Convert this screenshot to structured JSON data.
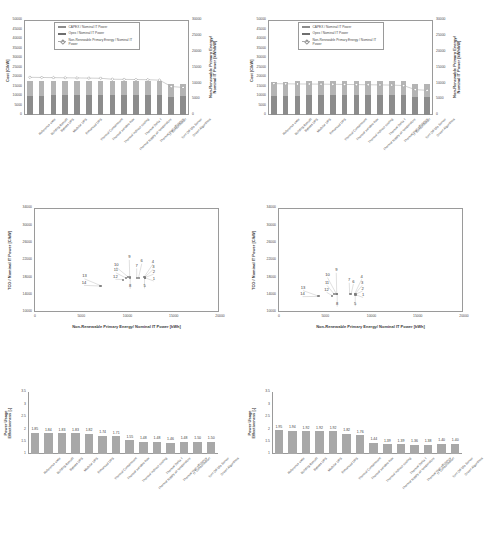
{
  "categories": [
    "Reference case",
    "Building Retrofit",
    "Bypass UPS",
    "Modular UPS",
    "Enhanced UPS",
    "Thermal Containment",
    "Thermal variable flow",
    "Thermal indirect cooling",
    "Thermal supply air temperature",
    "Thermal Delta T",
    "Thermal high efficiency",
    "IT Consolidation",
    "Turn Off Idle Server",
    "Green Algorithms"
  ],
  "combo_legend": {
    "capex": "CAPEX / Nominal IT Power",
    "opex": "Opex / Nominal IT Power",
    "energy": "Non-Renewable Primary Energy / Nominal IT Power"
  },
  "chart_data": [
    {
      "id": "combo-left",
      "type": "bar",
      "title": "",
      "xlabel": "",
      "ylabel": "Cost [C/kW]",
      "y2label": "Non-Renewable Primary Energy/ Nominal IT Power [kWh/kW]",
      "ylim": [
        0,
        50000
      ],
      "yticks": [
        0,
        5000,
        10000,
        15000,
        20000,
        25000,
        30000,
        35000,
        40000,
        45000,
        50000
      ],
      "y2lim": [
        0,
        30000
      ],
      "y2ticks": [
        0,
        5000,
        10000,
        15000,
        20000,
        25000,
        30000
      ],
      "grid": false,
      "legend_position": "top-center",
      "categories": [
        "Reference case",
        "Building Retrofit",
        "Bypass UPS",
        "Modular UPS",
        "Enhanced UPS",
        "Thermal Containment",
        "Thermal variable flow",
        "Thermal indirect cooling",
        "Thermal supply air temperature",
        "Thermal Delta T",
        "Thermal high efficiency",
        "IT Consolidation",
        "Turn Off Idle Server",
        "Green Algorithms"
      ],
      "series": [
        {
          "name": "CAPEX / Nominal IT Power",
          "values": [
            10200,
            10200,
            10300,
            10400,
            10500,
            10600,
            10700,
            10700,
            10700,
            10700,
            10700,
            10600,
            9700,
            9800
          ]
        },
        {
          "name": "Opex / Nominal IT Power",
          "values": [
            7600,
            7600,
            7500,
            7400,
            7300,
            7300,
            7300,
            7300,
            7300,
            7300,
            7300,
            7300,
            6500,
            6600
          ]
        },
        {
          "name": "Non-Renewable Primary Energy / Nominal IT Power",
          "values": [
            11900,
            11850,
            11800,
            11750,
            11700,
            11650,
            11600,
            11300,
            11250,
            11200,
            11150,
            11000,
            9000,
            8700
          ]
        }
      ]
    },
    {
      "id": "combo-right",
      "type": "bar",
      "title": "",
      "xlabel": "",
      "ylabel": "Cost [C/kW]",
      "y2label": "Non-Renewable Primary Energy/ Nominal IT Power [kWh/kW]",
      "ylim": [
        0,
        50000
      ],
      "yticks": [
        0,
        5000,
        10000,
        15000,
        20000,
        25000,
        30000,
        35000,
        40000,
        45000,
        50000
      ],
      "y2lim": [
        0,
        30000
      ],
      "y2ticks": [
        0,
        5000,
        10000,
        15000,
        20000,
        25000,
        30000
      ],
      "grid": false,
      "legend_position": "top-center",
      "categories": [
        "Reference case",
        "Building Retrofit",
        "Bypass UPS",
        "Modular UPS",
        "Enhanced UPS",
        "Thermal Containment",
        "Thermal variable flow",
        "Thermal indirect cooling",
        "Thermal supply air temperature",
        "Thermal Delta T",
        "Thermal high efficiency",
        "IT Consolidation",
        "Turn Off Idle Server",
        "Green Algorithms"
      ],
      "series": [
        {
          "name": "CAPEX / Nominal IT Power",
          "values": [
            10100,
            10100,
            10200,
            10300,
            10400,
            10500,
            10600,
            10700,
            10700,
            10700,
            10700,
            10600,
            9600,
            9700
          ]
        },
        {
          "name": "Opex / Nominal IT Power",
          "values": [
            7500,
            7500,
            7500,
            7400,
            7400,
            7400,
            7400,
            7400,
            7400,
            7400,
            7400,
            7400,
            6600,
            6700
          ]
        },
        {
          "name": "Non-Renewable Primary Energy / Nominal IT Power",
          "values": [
            9900,
            9850,
            9800,
            9780,
            9750,
            9700,
            9650,
            9600,
            9550,
            9500,
            9450,
            9300,
            8000,
            7800
          ]
        }
      ]
    },
    {
      "id": "scatter-left",
      "type": "scatter",
      "title": "",
      "xlabel": "Non-Renewable Primary Energy/ Nominal IT Power [kWh]",
      "ylabel": "TCO / Nominal IT Power [C/kW]",
      "xlim": [
        0,
        20000
      ],
      "xticks": [
        0,
        5000,
        10000,
        15000,
        20000
      ],
      "ylim": [
        10000,
        34000
      ],
      "yticks": [
        10000,
        14000,
        18000,
        22000,
        26000,
        30000,
        34000
      ],
      "grid": false,
      "points": [
        {
          "label": "1",
          "x": 12000,
          "y": 17900,
          "lx": 12950,
          "ly": 17700
        },
        {
          "label": "2",
          "x": 12000,
          "y": 17950,
          "lx": 12950,
          "ly": 19300
        },
        {
          "label": "3",
          "x": 11950,
          "y": 18000,
          "lx": 12900,
          "ly": 20400
        },
        {
          "label": "4",
          "x": 11900,
          "y": 18050,
          "lx": 12850,
          "ly": 21600
        },
        {
          "label": "5",
          "x": 11950,
          "y": 17850,
          "lx": 11950,
          "ly": 16000
        },
        {
          "label": "6",
          "x": 11300,
          "y": 17900,
          "lx": 11650,
          "ly": 21700
        },
        {
          "label": "7",
          "x": 11100,
          "y": 17950,
          "lx": 11100,
          "ly": 20600
        },
        {
          "label": "8",
          "x": 10400,
          "y": 17900,
          "lx": 10400,
          "ly": 15900
        },
        {
          "label": "9",
          "x": 10350,
          "y": 18000,
          "lx": 10300,
          "ly": 22600
        },
        {
          "label": "10",
          "x": 10200,
          "y": 18050,
          "lx": 8900,
          "ly": 20900
        },
        {
          "label": "11",
          "x": 9900,
          "y": 17900,
          "lx": 8850,
          "ly": 19600
        },
        {
          "label": "12",
          "x": 9600,
          "y": 17500,
          "lx": 8800,
          "ly": 18100
        },
        {
          "label": "13",
          "x": 7200,
          "y": 16100,
          "lx": 5450,
          "ly": 18200
        },
        {
          "label": "14",
          "x": 7150,
          "y": 16000,
          "lx": 5400,
          "ly": 16700
        }
      ]
    },
    {
      "id": "scatter-right",
      "type": "scatter",
      "title": "",
      "xlabel": "Non-Renewable Primary Energy/ Nominal IT Power [kWh]",
      "ylabel": "TCO / Nominal IT Power [C/kW]",
      "xlim": [
        0,
        20000
      ],
      "xticks": [
        0,
        5000,
        10000,
        15000,
        20000
      ],
      "ylim": [
        10000,
        34000
      ],
      "yticks": [
        10000,
        14000,
        18000,
        22000,
        26000,
        30000,
        34000
      ],
      "grid": false,
      "points": [
        {
          "label": "1",
          "x": 8400,
          "y": 14000,
          "lx": 9200,
          "ly": 13900
        },
        {
          "label": "2",
          "x": 8400,
          "y": 14100,
          "lx": 9150,
          "ly": 15400
        },
        {
          "label": "3",
          "x": 8350,
          "y": 14200,
          "lx": 9100,
          "ly": 16700
        },
        {
          "label": "4",
          "x": 8300,
          "y": 14250,
          "lx": 9050,
          "ly": 18100
        },
        {
          "label": "5",
          "x": 8350,
          "y": 13950,
          "lx": 8350,
          "ly": 11900
        },
        {
          "label": "6",
          "x": 7900,
          "y": 14050,
          "lx": 8150,
          "ly": 17000
        },
        {
          "label": "7",
          "x": 7750,
          "y": 14100,
          "lx": 7700,
          "ly": 17300
        },
        {
          "label": "8",
          "x": 6400,
          "y": 14050,
          "lx": 6400,
          "ly": 11800
        },
        {
          "label": "9",
          "x": 6350,
          "y": 14150,
          "lx": 6300,
          "ly": 19600
        },
        {
          "label": "10",
          "x": 6300,
          "y": 14200,
          "lx": 5350,
          "ly": 18500
        },
        {
          "label": "11",
          "x": 6100,
          "y": 14050,
          "lx": 5300,
          "ly": 16700
        },
        {
          "label": "12",
          "x": 5850,
          "y": 13800,
          "lx": 5250,
          "ly": 15100
        },
        {
          "label": "13",
          "x": 4400,
          "y": 13650,
          "lx": 2700,
          "ly": 15500
        },
        {
          "label": "14",
          "x": 4350,
          "y": 13600,
          "lx": 2650,
          "ly": 14100
        }
      ]
    },
    {
      "id": "pue-left",
      "type": "bar",
      "title": "",
      "xlabel": "",
      "ylabel": "Power Usage Effectiveness [-]",
      "ylim": [
        1,
        3.5
      ],
      "yticks": [
        1,
        1.5,
        2,
        2.5,
        3,
        3.5
      ],
      "grid": false,
      "categories": [
        "Reference case",
        "Building Retrofit",
        "Bypass UPS",
        "Modular UPS",
        "Enhanced UPS",
        "Thermal Containment",
        "Thermal variable flow",
        "Thermal indirect cooling",
        "Thermal supply air temperature",
        "Thermal Delta T",
        "Thermal high efficiency",
        "IT Consolidation",
        "Turn Off Idle Server",
        "Green Algorithms"
      ],
      "values": [
        1.85,
        1.84,
        1.83,
        1.83,
        1.82,
        1.74,
        1.71,
        1.55,
        1.48,
        1.48,
        1.46,
        1.48,
        1.5,
        1.5
      ],
      "datalabels": [
        "1.85",
        "1.84",
        "1.83",
        "1.83",
        "1.82",
        "1.74",
        "1.71",
        "1.55",
        "1.48",
        "1.48",
        "1.46",
        "1.48",
        "1.50",
        "1.50"
      ]
    },
    {
      "id": "pue-right",
      "type": "bar",
      "title": "",
      "xlabel": "",
      "ylabel": "Power Usage Effectiveness [-]",
      "ylim": [
        1,
        3.5
      ],
      "yticks": [
        1,
        1.5,
        2,
        2.5,
        3,
        3.5
      ],
      "grid": false,
      "categories": [
        "Reference case",
        "Building Retrofit",
        "Bypass UPS",
        "Modular UPS",
        "Enhanced UPS",
        "Thermal Containment",
        "Thermal variable flow",
        "Thermal indirect cooling",
        "Thermal supply air temperature",
        "Thermal Delta T",
        "Thermal high efficiency",
        "IT Consolidation",
        "Turn Off Idle Server",
        "Green Algorithms"
      ],
      "values": [
        1.95,
        1.94,
        1.92,
        1.92,
        1.92,
        1.82,
        1.76,
        1.44,
        1.39,
        1.39,
        1.36,
        1.38,
        1.4,
        1.4
      ],
      "datalabels": [
        "1.95",
        "1.94",
        "1.92",
        "1.92",
        "1.92",
        "1.82",
        "1.76",
        "1.44",
        "1.39",
        "1.39",
        "1.36",
        "1.38",
        "1.40",
        "1.40"
      ]
    }
  ]
}
